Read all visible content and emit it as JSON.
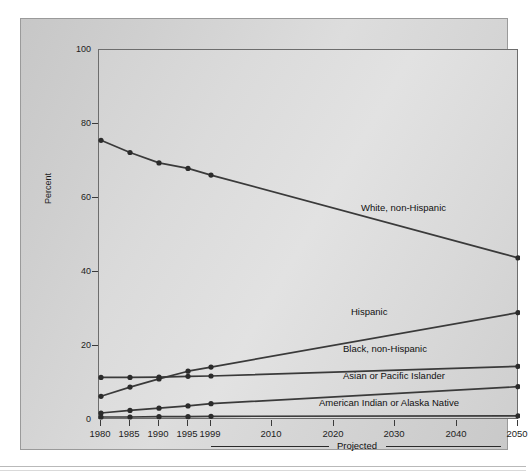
{
  "chart_data": {
    "type": "line",
    "title": "",
    "xlabel": "",
    "ylabel": "Percent",
    "ylim": [
      0,
      100
    ],
    "yticks": [
      0,
      20,
      40,
      60,
      80,
      100
    ],
    "xticks": [
      "1980",
      "1985",
      "1990",
      "1995",
      "1999",
      "2010",
      "2020",
      "2030",
      "2040",
      "2050"
    ],
    "grid": false,
    "legend_position": "inline-annotations",
    "annotations": [
      "Projected"
    ],
    "projected_note": "Projected",
    "series": [
      {
        "name": "White, non-Hispanic",
        "x": [
          "1980",
          "1985",
          "1990",
          "1995",
          "1999",
          "2050"
        ],
        "values": [
          75.6,
          72.3,
          69.5,
          68.0,
          66.2,
          43.8
        ]
      },
      {
        "name": "Hispanic",
        "x": [
          "1980",
          "1985",
          "1990",
          "1995",
          "1999",
          "2050"
        ],
        "values": [
          6.4,
          8.9,
          11.1,
          13.2,
          14.3,
          29.0
        ]
      },
      {
        "name": "Black, non-Hispanic",
        "x": [
          "1980",
          "1985",
          "1990",
          "1995",
          "1999",
          "2050"
        ],
        "values": [
          11.5,
          11.5,
          11.6,
          11.8,
          11.9,
          14.5
        ]
      },
      {
        "name": "Asian or Pacific Islander",
        "x": [
          "1980",
          "1985",
          "1990",
          "1995",
          "1999",
          "2050"
        ],
        "values": [
          1.9,
          2.6,
          3.2,
          3.8,
          4.4,
          9.0
        ]
      },
      {
        "name": "American Indian or Alaska Native",
        "x": [
          "1980",
          "1985",
          "1990",
          "1995",
          "1999",
          "2050"
        ],
        "values": [
          0.8,
          0.8,
          0.9,
          0.9,
          1.0,
          1.1
        ]
      }
    ]
  },
  "axis": {
    "y_title": "Percent",
    "y_ticks": [
      "100",
      "80",
      "60",
      "40",
      "20",
      "0"
    ],
    "x_ticks": [
      "1980",
      "1985",
      "1990",
      "1995",
      "1999",
      "2010",
      "2020",
      "2030",
      "2040",
      "2050"
    ]
  },
  "labels": {
    "white": "White, non-Hispanic",
    "hispanic": "Hispanic",
    "black": "Black, non-Hispanic",
    "asian": "Asian or Pacific Islander",
    "aian": "American Indian or Alaska Native",
    "projected": "Projected"
  },
  "colors": {
    "line": "#3a3a3a",
    "marker": "#2b2b2b",
    "plot_border": "#6d6d6d",
    "panel_border": "#9a9a9a",
    "text": "#1d1d1d"
  }
}
